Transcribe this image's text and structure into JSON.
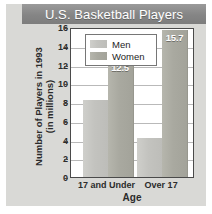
{
  "figure": {
    "title": "U.S. Basketball Players",
    "colors": {
      "title_banner": "#8c8c8c",
      "title_text": "#ffffff",
      "card_background": "#d9d9d6",
      "plot_background": "#ffffff",
      "axis_line": "#4a4a4a",
      "gridline": "#b9b9b9",
      "men_bar": "#c3c3bf",
      "women_bar": "#a9a9a0",
      "bar_label_text": "#ffffff"
    }
  },
  "chart_data": {
    "type": "bar",
    "title": "U.S. Basketball Players",
    "xlabel": "Age",
    "ylabel": "Number of Players in 1993\n(in millions)",
    "categories": [
      "17 and Under",
      "Over 17"
    ],
    "series": [
      {
        "name": "Men",
        "values": [
          8.2,
          4.2
        ],
        "labels": [
          "",
          ""
        ]
      },
      {
        "name": "Women",
        "values": [
          12.5,
          15.7
        ],
        "labels": [
          "12.5",
          "15.7"
        ]
      }
    ],
    "ylim": [
      0,
      16
    ],
    "yticks": [
      0,
      2,
      4,
      6,
      8,
      10,
      12,
      14,
      16
    ],
    "ytick_labels": [
      "0",
      "2",
      "4",
      "6",
      "8",
      "10",
      "12",
      "14",
      "16"
    ],
    "grid": true,
    "legend_position": "upper left",
    "legend_entries": [
      "Men",
      "Women"
    ]
  }
}
